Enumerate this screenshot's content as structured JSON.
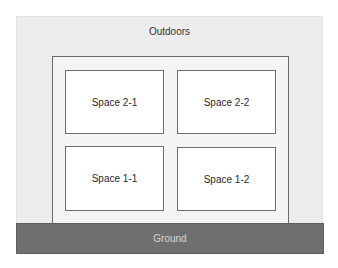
{
  "diagram": {
    "outdoors": {
      "label": "Outdoors",
      "color": "#ececec"
    },
    "building": {
      "rooms": [
        {
          "id": "space-2-1",
          "label": "Space 2-1"
        },
        {
          "id": "space-2-2",
          "label": "Space 2-2"
        },
        {
          "id": "space-1-1",
          "label": "Space 1-1"
        },
        {
          "id": "space-1-2",
          "label": "Space 1-2"
        }
      ]
    },
    "ground": {
      "label": "Ground",
      "color": "#6f6f6f"
    }
  }
}
